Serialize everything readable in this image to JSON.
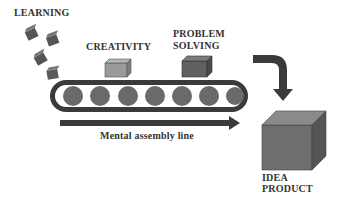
{
  "labels": {
    "learning": "LEARNING",
    "creativity": "CREATIVITY",
    "problem_solving_1": "PROBLEM",
    "problem_solving_2": "SOLVING",
    "assembly_line": "Mental assembly line",
    "idea_product_1": "IDEA",
    "idea_product_2": "PRODUCT"
  },
  "colors": {
    "belt": "#3a3a3a",
    "roller": "#6a6a6a",
    "creativity_box": "#9a9a9a",
    "problem_box": "#606060",
    "product_box": "#707070",
    "arrow": "#3a3a3a"
  }
}
